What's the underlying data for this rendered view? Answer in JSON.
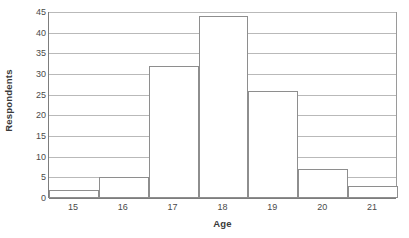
{
  "chart_data": {
    "type": "bar",
    "title": "",
    "subtitle": "",
    "xlabel": "Age",
    "ylabel": "Respondents",
    "categories": [
      "15",
      "16",
      "17",
      "18",
      "19",
      "20",
      "21"
    ],
    "values": [
      2,
      5,
      32,
      44,
      26,
      7,
      3
    ],
    "series": [
      {
        "name": "Respondents",
        "values": [
          2,
          5,
          32,
          44,
          26,
          7,
          3
        ]
      }
    ],
    "ylim": [
      0,
      45
    ],
    "xlim": [
      14.5,
      21.5
    ],
    "y_ticks": [
      0,
      5,
      10,
      15,
      20,
      25,
      30,
      35,
      40,
      45
    ],
    "y_tick_labels": [
      "0",
      "5",
      "10",
      "15",
      "20",
      "25",
      "30",
      "35",
      "40",
      "45"
    ],
    "x_tick_labels": [
      "15",
      "16",
      "17",
      "18",
      "19",
      "20",
      "21"
    ],
    "grid": true,
    "grid_axis": "y",
    "legend": false,
    "legend_position": "none",
    "bar_gap": 0,
    "annotations": []
  },
  "style": {
    "background_color": "#ffffff",
    "bar_fill_color": "#ffffff",
    "bar_border_color": "#8e8e8e",
    "gridline_color": "#b9b9b9",
    "axis_line_color": "#7d7d7d",
    "text_color": "#3a3a3a",
    "tick_text_color": "#4a4a4a"
  }
}
